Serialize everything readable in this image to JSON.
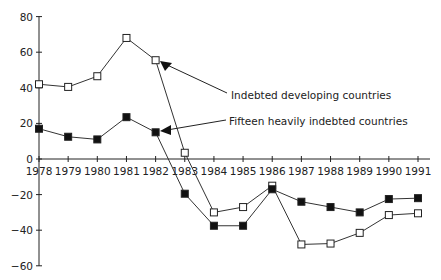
{
  "chart_data": {
    "type": "line",
    "title": "",
    "xlabel": "",
    "ylabel": "",
    "ylim": [
      -60,
      80
    ],
    "yticks": [
      80,
      60,
      40,
      20,
      0,
      -20,
      -40,
      -60
    ],
    "grid": false,
    "x": [
      1978,
      1979,
      1980,
      1981,
      1982,
      1983,
      1984,
      1985,
      1986,
      1987,
      1988,
      1989,
      1990,
      1991
    ],
    "series": [
      {
        "name": "Indebted developing countries",
        "marker": "open-square",
        "values": [
          42,
          40.5,
          46.5,
          68,
          55.5,
          3.5,
          -30,
          -27,
          -15,
          -48,
          -47.5,
          -41.5,
          -31.5,
          -30.5
        ]
      },
      {
        "name": "Fifteen heavily indebted countries",
        "marker": "filled-square",
        "values": [
          17,
          12.5,
          11,
          23.5,
          15,
          -19.5,
          -37.5,
          -37.5,
          -17,
          -24,
          -27,
          -30,
          -22.5,
          -22
        ]
      }
    ],
    "annotations": [
      {
        "text": "Indebted developing countries",
        "points_to_series": 0,
        "points_to_year": 1982
      },
      {
        "text": "Fifteen heavily indebted countries",
        "points_to_series": 1,
        "points_to_year": 1982
      }
    ],
    "legend_position": "inline-annotations"
  },
  "labels": {
    "annotation_developing": "Indebted developing countries",
    "annotation_fifteen": "Fifteen heavily indebted countries"
  }
}
